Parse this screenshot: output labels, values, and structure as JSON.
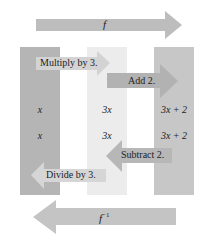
{
  "diagram": {
    "top_arrow": {
      "label": "f",
      "direction": "right",
      "color": "#bdbdbd"
    },
    "bottom_arrow": {
      "label": "f",
      "superscript": "−1",
      "direction": "left",
      "color": "#c4c4c4"
    },
    "columns": [
      {
        "name": "input",
        "color": "#b5b5b5",
        "values": [
          "x",
          "x"
        ]
      },
      {
        "name": "middle",
        "color": "#ececec",
        "values": [
          "3x",
          "3x"
        ]
      },
      {
        "name": "output",
        "color": "#c7c7c7",
        "values": [
          "3x + 2",
          "3x + 2"
        ]
      }
    ],
    "steps": {
      "multiply": "Multiply by 3.",
      "add": "Add 2.",
      "subtract": "Subtract 2.",
      "divide": "Divide by 3."
    },
    "step_arrow_colors": {
      "multiply": "#d3d3d3",
      "add": "#b2b2b2",
      "subtract": "#b7b7b7",
      "divide": "#d6d6d6"
    }
  }
}
